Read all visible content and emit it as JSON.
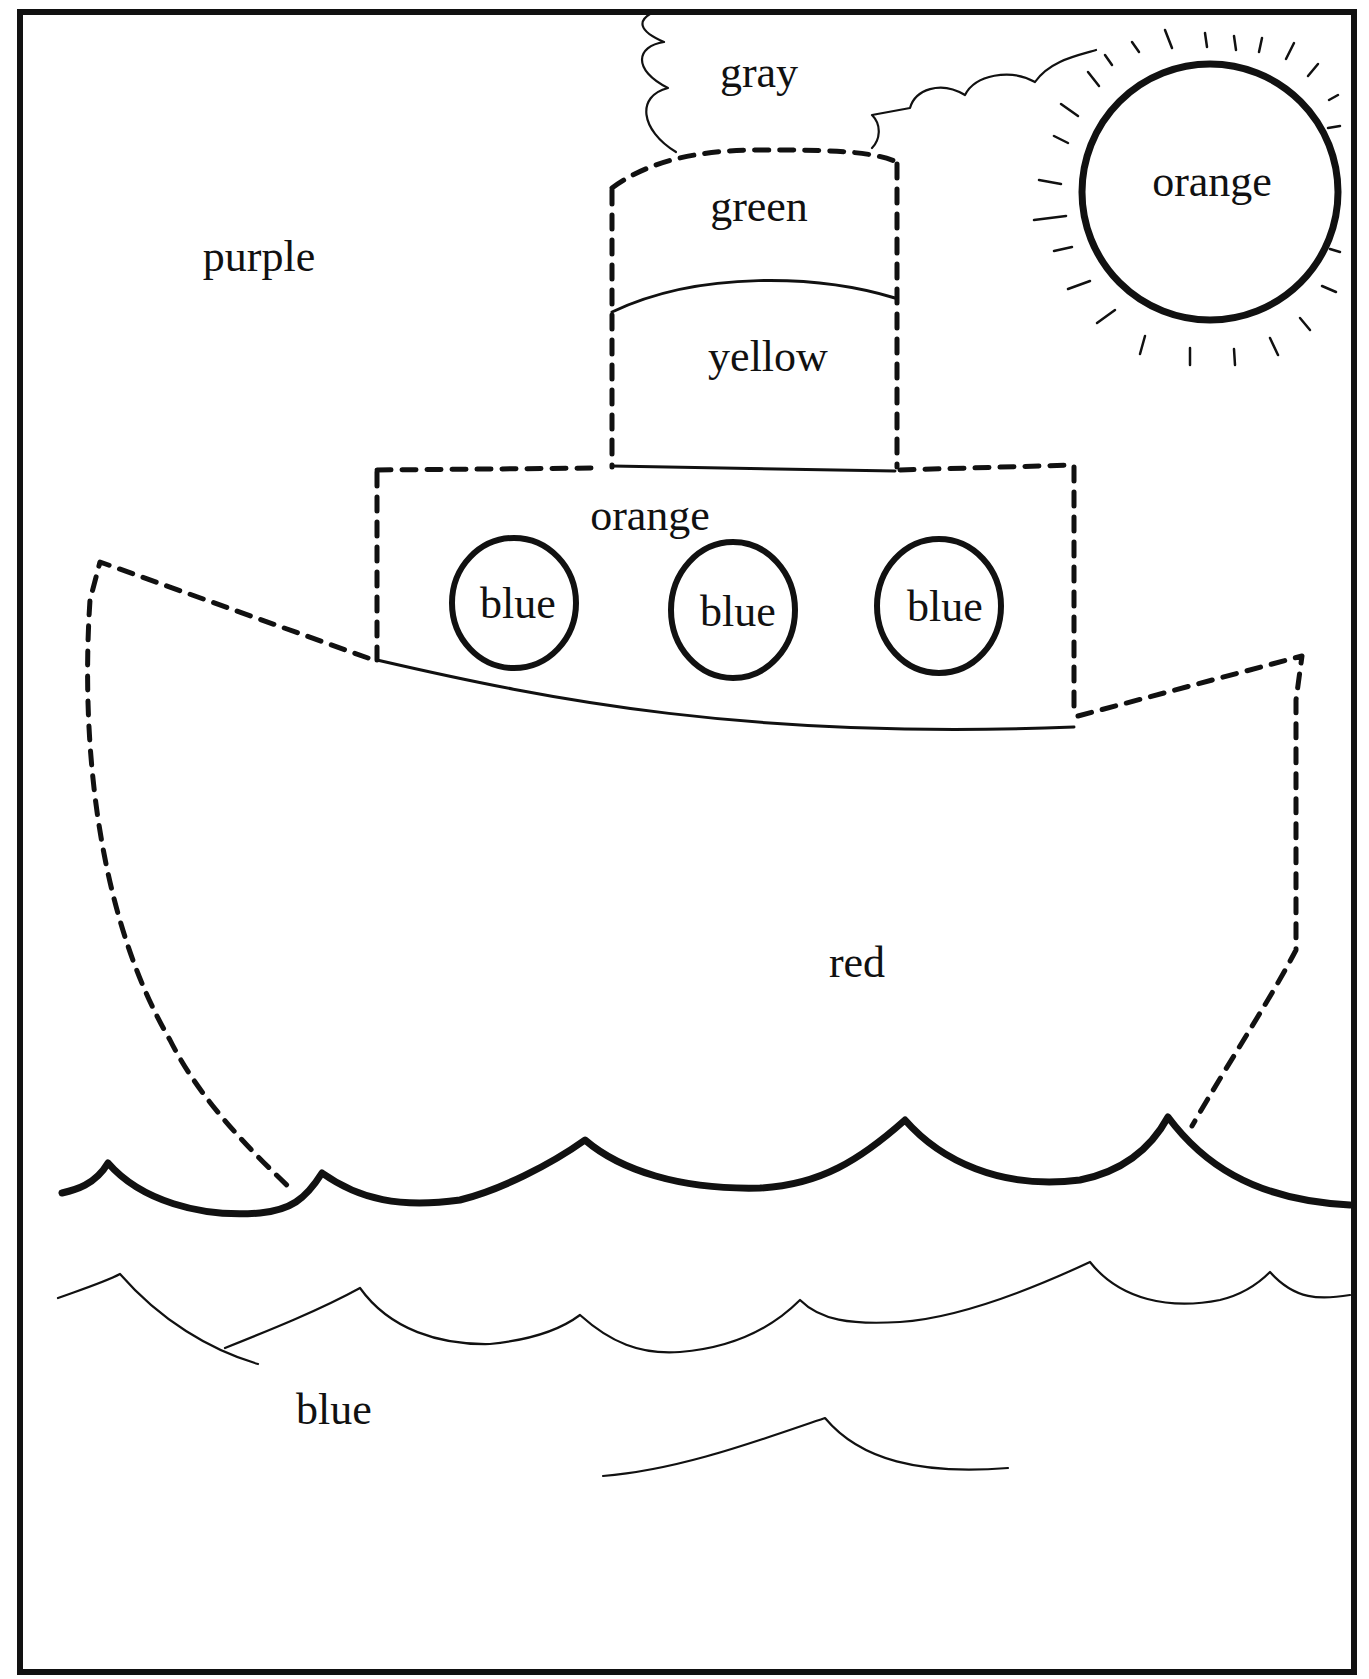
{
  "worksheet": {
    "type": "color-by-word coloring page",
    "subject": "steamboat on the sea",
    "regions": {
      "sky": "purple",
      "cloud": "gray",
      "smokestack_top": "green",
      "smokestack_bottom": "yellow",
      "sun": "orange",
      "cabin": "orange",
      "porthole_1": "blue",
      "porthole_2": "blue",
      "porthole_3": "blue",
      "hull": "red",
      "sea": "blue"
    }
  },
  "colors": {
    "ink": "#111111",
    "paper": "#ffffff"
  }
}
